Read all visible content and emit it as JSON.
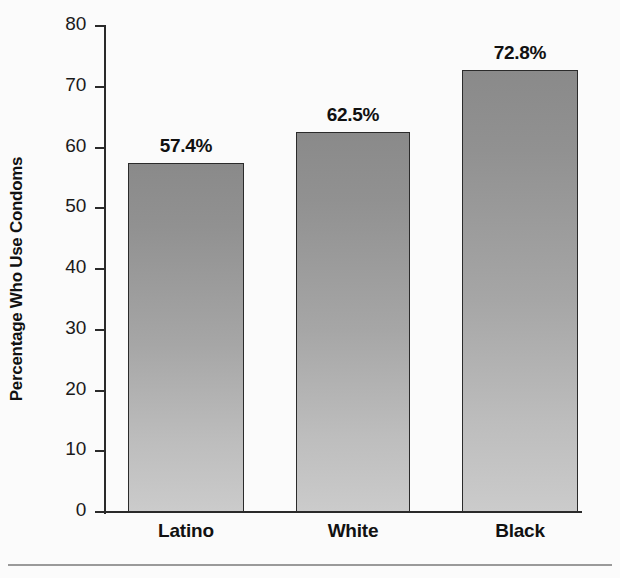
{
  "chart_data": {
    "type": "bar",
    "title": "",
    "subtitle": "",
    "xlabel": "",
    "ylabel": "Percentage Who Use Condoms",
    "categories": [
      "Latino",
      "White",
      "Black"
    ],
    "values": [
      57.4,
      62.5,
      72.8
    ],
    "value_labels": [
      "57.4%",
      "62.5%",
      "72.8%"
    ],
    "ylim": [
      0,
      80
    ],
    "ytick_values": [
      0,
      10,
      20,
      30,
      40,
      50,
      60,
      70,
      80
    ],
    "ytick_labels": [
      "0",
      "10",
      "20",
      "30",
      "40",
      "50",
      "60",
      "70",
      "80"
    ],
    "grid": false,
    "legend": false,
    "legend_position": "none",
    "series": [
      {
        "name": "Percentage Who Use Condoms",
        "values": [
          57.4,
          62.5,
          72.8
        ]
      }
    ]
  },
  "style": {
    "bar_fill_top": "#8a8a8a",
    "bar_fill_bottom": "#cbcbcb",
    "bar_border": "#2b2b2b",
    "axis_color": "#2a2a2a",
    "text_color": "#111111",
    "background": "#fbfbfb",
    "rule_color": "#9a9a9a"
  }
}
